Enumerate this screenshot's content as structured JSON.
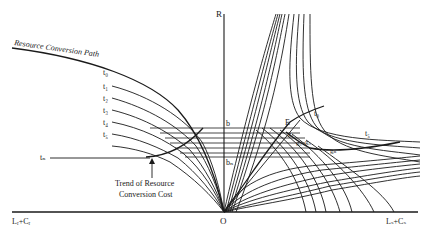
{
  "diagram": {
    "axes": {
      "y_label": "R",
      "origin_label": "O",
      "x_left_label": "Lᵣ+Cᵣ",
      "x_right_label": "Lₛ+Cₛ"
    },
    "left_panel": {
      "path_label": "Resource Conversion Path",
      "curve_labels": [
        "t₀",
        "t₁",
        "t₂",
        "t₃",
        "t₄",
        "t₅"
      ],
      "tn_label": "tₙ",
      "trend_label_line1": "Trend of Resource",
      "trend_label_line2": "Conversion Cost"
    },
    "center": {
      "b_label": "b",
      "bn_label": "bₙ"
    },
    "right_panel": {
      "E_label": "E",
      "g_labels": [
        "g₁",
        "g₂",
        "g₃",
        "gₙ"
      ],
      "t0_label": "t₀",
      "t5_label": "t₅"
    },
    "colors": {
      "ink": "#1a1a1a",
      "background": "#ffffff"
    }
  }
}
